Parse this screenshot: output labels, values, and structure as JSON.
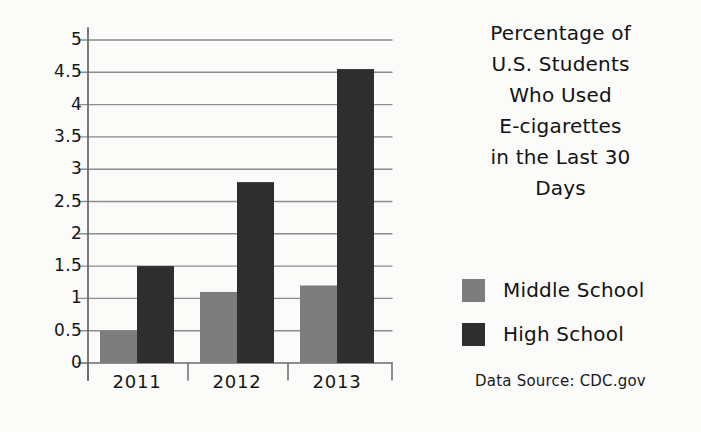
{
  "chart_data": {
    "type": "bar",
    "title_lines": [
      "Percentage of",
      "U.S. Students",
      "Who Used",
      "E-cigarettes",
      "in the Last 30",
      "Days"
    ],
    "categories": [
      "2011",
      "2012",
      "2013"
    ],
    "series": [
      {
        "name": "Middle School",
        "color": "#7d7d7d",
        "values": [
          0.5,
          1.1,
          1.2
        ]
      },
      {
        "name": "High School",
        "color": "#2e2e2e",
        "values": [
          1.5,
          2.8,
          4.55
        ]
      }
    ],
    "xlabel": "",
    "ylabel": "",
    "ylim": [
      0,
      5
    ],
    "ytick_values": [
      0,
      0.5,
      1,
      1.5,
      2,
      2.5,
      3,
      3.5,
      4,
      4.5,
      5
    ],
    "ytick_labels": [
      "0",
      "0.5",
      "1",
      "1.5",
      "2",
      "2.5",
      "3",
      "3.5",
      "4",
      "4.5",
      "5"
    ],
    "grid": true,
    "legend_position": "right",
    "source_note": "Data Source: CDC.gov"
  },
  "legend": {
    "entries": [
      {
        "label": "Middle School",
        "color": "#7d7d7d"
      },
      {
        "label": "High School",
        "color": "#2e2e2e"
      }
    ]
  },
  "footer": {
    "source": "Data Source: CDC.gov"
  },
  "colors": {
    "background": "#fbfbfa",
    "axis": "#6b6b6b",
    "grid": "#8c8c8c",
    "text": "#161616",
    "middle_school": "#7d7d7d",
    "high_school": "#2e2e2e"
  }
}
